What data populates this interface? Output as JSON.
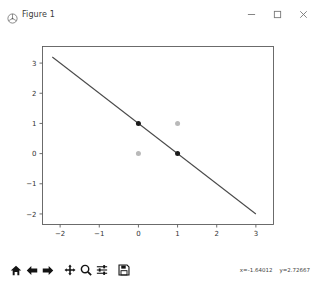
{
  "window": {
    "title": "Figure 1",
    "app_icon": "matplotlib-icon",
    "controls": [
      {
        "name": "minimize",
        "glyph": "minimize-icon"
      },
      {
        "name": "maximize",
        "glyph": "maximize-icon"
      },
      {
        "name": "close",
        "glyph": "close-icon"
      }
    ]
  },
  "toolbar": {
    "buttons": [
      {
        "name": "home",
        "icon": "home-icon",
        "tooltip": "Reset original view"
      },
      {
        "name": "back",
        "icon": "back-arrow-icon",
        "tooltip": "Back to previous view"
      },
      {
        "name": "forward",
        "icon": "forward-arrow-icon",
        "tooltip": "Forward to next view"
      },
      {
        "name": "pan",
        "icon": "pan-move-icon",
        "tooltip": "Pan axes with left mouse, zoom with right"
      },
      {
        "name": "zoom",
        "icon": "magnifier-icon",
        "tooltip": "Zoom to rectangle"
      },
      {
        "name": "configure-subplots",
        "icon": "sliders-icon",
        "tooltip": "Configure subplots"
      },
      {
        "name": "save",
        "icon": "floppy-disk-icon",
        "tooltip": "Save the figure"
      }
    ],
    "cursor_x_label": "x=-1.64012",
    "cursor_y_label": "y=2.72667"
  },
  "chart_data": {
    "type": "scatter",
    "title": "",
    "xlabel": "",
    "ylabel": "",
    "xlim": [
      -2.45,
      3.45
    ],
    "ylim": [
      -2.35,
      3.55
    ],
    "xticks": [
      -2,
      -1,
      0,
      1,
      2,
      3
    ],
    "yticks": [
      -2,
      -1,
      0,
      1,
      2,
      3
    ],
    "xtick_labels": [
      "−2",
      "−1",
      "0",
      "1",
      "2",
      "3"
    ],
    "ytick_labels": [
      "−2",
      "−1",
      "0",
      "1",
      "2",
      "3"
    ],
    "grid": false,
    "legend": null,
    "series": [
      {
        "name": "class-1",
        "type": "scatter",
        "marker": "circle",
        "color": "#1b1b1b",
        "size": 5,
        "points": [
          {
            "x": 0,
            "y": 1
          },
          {
            "x": 1,
            "y": 0
          }
        ]
      },
      {
        "name": "class-0",
        "type": "scatter",
        "marker": "circle",
        "color": "#b9b9b9",
        "size": 5,
        "points": [
          {
            "x": 0,
            "y": 0
          },
          {
            "x": 1,
            "y": 1
          }
        ]
      },
      {
        "name": "decision-boundary",
        "type": "line",
        "color": "#4a4a4a",
        "width": 1.1,
        "points": [
          {
            "x": -2.2,
            "y": 3.2
          },
          {
            "x": 3.0,
            "y": -2.0
          }
        ]
      }
    ]
  }
}
